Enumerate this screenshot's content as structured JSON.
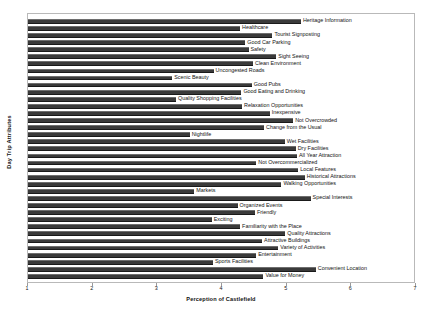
{
  "chart_data": {
    "type": "bar",
    "orientation": "horizontal",
    "title": "",
    "xlabel": "Perception of Castlefield",
    "ylabel": "Day Trip Attributes",
    "xlim": [
      1,
      7
    ],
    "xticks": [
      "1",
      "2",
      "3",
      "4",
      "5",
      "6",
      "7"
    ],
    "grid": false,
    "legend": "none",
    "bar_color": "#3a3a3a",
    "categories": [
      "Heritage Information",
      "Healthcare",
      "Tourist Signposting",
      "Good Car Parking",
      "Safety",
      "Sight Seeing",
      "Clean Environment",
      "Uncongested Roads",
      "Scenic Beauty",
      "Good Pubs",
      "Good Eating and Drinking",
      "Quality Shopping Facilities",
      "Relaxation Opportunities",
      "Inexpensive",
      "Not Overcrowded",
      "Change from the Usual",
      "Nightlife",
      "Wet Facilities",
      "Dry Facilities",
      "All Year Attraction",
      "Not Overcommercialized",
      "Local Features",
      "Historical Attractions",
      "Walking Opportunities",
      "Markets",
      "Special Interests",
      "Organized Events",
      "Friendly",
      "Exciting",
      "Familiarity with the Place",
      "Quality Attractions",
      "Attractive Buildings",
      "Variety of Activities",
      "Entertainment",
      "Sports Facilities",
      "Convenient Location",
      "Value for Money"
    ],
    "values": [
      5.22,
      4.28,
      4.78,
      4.36,
      4.41,
      4.84,
      4.48,
      3.87,
      3.23,
      4.46,
      4.3,
      3.29,
      4.31,
      4.74,
      5.1,
      4.65,
      3.5,
      4.97,
      5.14,
      5.16,
      4.53,
      5.18,
      5.28,
      4.92,
      3.57,
      5.37,
      4.24,
      4.51,
      3.84,
      4.28,
      4.98,
      4.62,
      4.87,
      4.53,
      3.86,
      5.45,
      4.64
    ]
  }
}
